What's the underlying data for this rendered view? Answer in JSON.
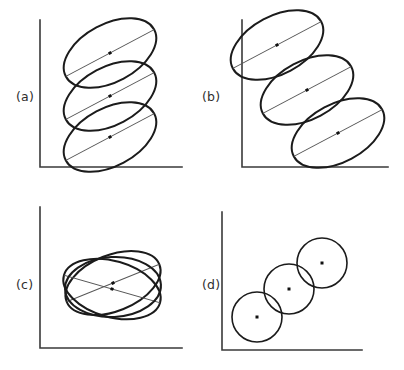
{
  "figure": {
    "caption_style": "lettered-panels",
    "background_color": "#ffffff",
    "stroke_color": "#1b1b1b",
    "axis_color": "#3a3a3a",
    "dot_color": "#111111",
    "width": 404,
    "height": 370
  },
  "panels": [
    {
      "id": "a",
      "label": "(a)",
      "label_x": 16,
      "label_y": 101,
      "axis": {
        "x0": 40,
        "y0": 20,
        "x1": 40,
        "y1": 167,
        "x2": 182,
        "y2": 167
      },
      "shape_kind": "ellipse",
      "description": "three congruent tilted ellipses stacked vertically at constant x",
      "shapes": [
        {
          "cx": 110,
          "cy": 53,
          "rx": 50,
          "ry": 29,
          "rotation": -28,
          "major_axis": true,
          "dot": true
        },
        {
          "cx": 110,
          "cy": 96,
          "rx": 50,
          "ry": 29,
          "rotation": -28,
          "major_axis": true,
          "dot": true
        },
        {
          "cx": 110,
          "cy": 137,
          "rx": 50,
          "ry": 29,
          "rotation": -28,
          "major_axis": true,
          "dot": true
        }
      ]
    },
    {
      "id": "b",
      "label": "(b)",
      "label_x": 202,
      "label_y": 101,
      "axis": {
        "x0": 242,
        "y0": 20,
        "x1": 242,
        "y1": 167,
        "x2": 388,
        "y2": 167
      },
      "shape_kind": "ellipse",
      "description": "three congruent tilted ellipses arranged along a descending diagonal",
      "shapes": [
        {
          "cx": 277,
          "cy": 45,
          "rx": 50,
          "ry": 29,
          "rotation": -28,
          "major_axis": true,
          "dot": true
        },
        {
          "cx": 307,
          "cy": 90,
          "rx": 50,
          "ry": 29,
          "rotation": -28,
          "major_axis": true,
          "dot": true
        },
        {
          "cx": 338,
          "cy": 133,
          "rx": 50,
          "ry": 29,
          "rotation": -28,
          "major_axis": true,
          "dot": true
        }
      ]
    },
    {
      "id": "c",
      "label": "(c)",
      "label_x": 16,
      "label_y": 289,
      "axis": {
        "x0": 40,
        "y0": 207,
        "x1": 40,
        "y1": 348,
        "x2": 182,
        "y2": 348
      },
      "shape_kind": "ellipse",
      "description": "three concentric ellipses with differing orientations, overlapping",
      "shapes": [
        {
          "cx": 113,
          "cy": 283,
          "rx": 50,
          "ry": 28,
          "rotation": -22,
          "major_axis": true,
          "dot": true
        },
        {
          "cx": 112,
          "cy": 289,
          "rx": 50,
          "ry": 28,
          "rotation": 16,
          "major_axis": true,
          "dot": true
        },
        {
          "cx": 113,
          "cy": 287,
          "rx": 48,
          "ry": 30,
          "rotation": -3,
          "major_axis": false,
          "dot": false
        }
      ]
    },
    {
      "id": "d",
      "label": "(d)",
      "label_x": 202,
      "label_y": 289,
      "axis": {
        "x0": 222,
        "y0": 212,
        "x1": 222,
        "y1": 350,
        "x2": 362,
        "y2": 350
      },
      "shape_kind": "circle",
      "description": "three congruent circles arranged along an ascending diagonal",
      "shapes": [
        {
          "cx": 257,
          "cy": 317,
          "rx": 25,
          "ry": 25,
          "rotation": 0,
          "major_axis": false,
          "dot": true
        },
        {
          "cx": 289,
          "cy": 289,
          "rx": 25,
          "ry": 25,
          "rotation": 0,
          "major_axis": false,
          "dot": true
        },
        {
          "cx": 322,
          "cy": 263,
          "rx": 25,
          "ry": 25,
          "rotation": 0,
          "major_axis": false,
          "dot": true
        }
      ]
    }
  ],
  "chart_data": {
    "type": "scatter",
    "title": "",
    "xlabel": "",
    "ylabel": "",
    "grid": false,
    "legend": null,
    "panel_count": 4,
    "panel_labels": [
      "(a)",
      "(b)",
      "(c)",
      "(d)"
    ],
    "series": [
      {
        "name": "(a) vertically stacked ellipses",
        "shape": "ellipse",
        "rotation_deg": [
          -28,
          -28,
          -28
        ],
        "centers": [
          [
            110,
            53
          ],
          [
            110,
            96
          ],
          [
            110,
            137
          ]
        ],
        "semi_axes": [
          [
            50,
            29
          ],
          [
            50,
            29
          ],
          [
            50,
            29
          ]
        ]
      },
      {
        "name": "(b) diagonally offset ellipses",
        "shape": "ellipse",
        "rotation_deg": [
          -28,
          -28,
          -28
        ],
        "centers": [
          [
            277,
            45
          ],
          [
            307,
            90
          ],
          [
            338,
            133
          ]
        ],
        "semi_axes": [
          [
            50,
            29
          ],
          [
            50,
            29
          ],
          [
            50,
            29
          ]
        ]
      },
      {
        "name": "(c) concentric rotated ellipses",
        "shape": "ellipse",
        "rotation_deg": [
          -22,
          16,
          -3
        ],
        "centers": [
          [
            113,
            283
          ],
          [
            112,
            289
          ],
          [
            113,
            287
          ]
        ],
        "semi_axes": [
          [
            50,
            28
          ],
          [
            50,
            28
          ],
          [
            48,
            30
          ]
        ]
      },
      {
        "name": "(d) diagonally offset circles",
        "shape": "circle",
        "rotation_deg": [
          0,
          0,
          0
        ],
        "centers": [
          [
            257,
            317
          ],
          [
            289,
            289
          ],
          [
            322,
            263
          ]
        ],
        "semi_axes": [
          [
            25,
            25
          ],
          [
            25,
            25
          ],
          [
            25,
            25
          ]
        ]
      }
    ]
  }
}
